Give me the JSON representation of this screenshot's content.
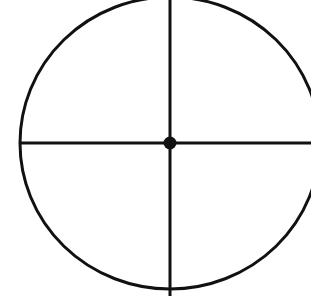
{
  "figure": {
    "kind": "geometric-diagram",
    "canvas": {
      "width": 311,
      "height": 296,
      "background_color": "#ffffff"
    },
    "stroke_color": "#111111",
    "center": {
      "label": "center-point",
      "x": 170,
      "y": 143,
      "dot_radius": 6.5,
      "fill_color": "#111111"
    },
    "circle": {
      "label": "circle-outline",
      "cx": 170,
      "cy": 143,
      "rx": 150,
      "ry": 146,
      "stroke_width": 3,
      "fill": "none",
      "clipped_edges": "top, right"
    },
    "vertical_diameter": {
      "label": "vertical-diameter-line",
      "x": 170,
      "y1": 0,
      "y2": 296,
      "stroke_width": 3
    },
    "horizontal_diameter": {
      "label": "horizontal-diameter-line",
      "y": 143,
      "x1": 20,
      "x2": 311,
      "stroke_width": 3
    }
  }
}
